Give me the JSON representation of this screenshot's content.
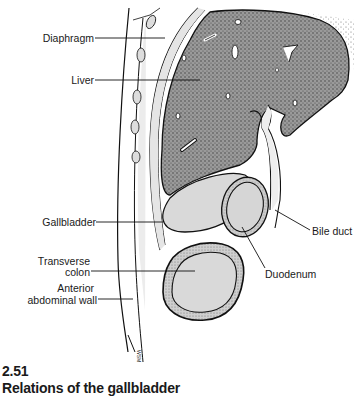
{
  "figure": {
    "number": "2.51",
    "title": "Relations of the gallbladder",
    "signature": "WSM"
  },
  "labels": {
    "diaphragm": "Diaphragm",
    "liver": "Liver",
    "gallbladder": "Gallbladder",
    "transverse_colon_line1": "Transverse",
    "transverse_colon_line2": "colon",
    "anterior_wall_line1": "Anterior",
    "anterior_wall_line2": "abdominal wall",
    "bile_duct": "Bile duct",
    "duodenum": "Duodenum"
  },
  "colors": {
    "liver_fill": "#8a8a8a",
    "organ_fill": "#d9d9d9",
    "outline": "#111111",
    "label_text": "#1a1a1a"
  }
}
